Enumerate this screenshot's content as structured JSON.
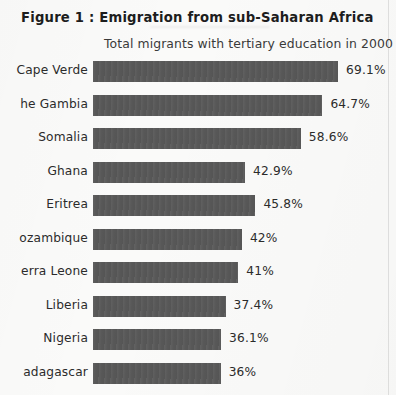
{
  "figure": {
    "title": "Figure 1 : Emigration from sub-Saharan Africa",
    "subtitle": "Total migrants with tertiary education in 2000"
  },
  "chart_data": {
    "type": "bar",
    "orientation": "horizontal",
    "title": "Figure 1 : Emigration from sub-Saharan Africa",
    "subtitle": "Total migrants with tertiary education in 2000",
    "xlabel": "",
    "ylabel": "",
    "xlim": [
      0,
      69.1
    ],
    "grid": false,
    "legend": false,
    "bar_color": "#585858",
    "value_label_suffix": "%",
    "categories": [
      "Cape Verde",
      "The Gambia",
      "Somalia",
      "Ghana",
      "Eritrea",
      "Mozambique",
      "Sierra Leone",
      "Liberia",
      "Nigeria",
      "Madagascar"
    ],
    "category_labels_as_shown": [
      "Cape Verde",
      "he Gambia",
      "Somalia",
      "Ghana",
      "Eritrea",
      "ozambique",
      "erra Leone",
      "Liberia",
      "Nigeria",
      "adagascar"
    ],
    "values": [
      69.1,
      64.7,
      58.6,
      42.9,
      45.8,
      42,
      41,
      37.4,
      36.1,
      36
    ],
    "value_labels": [
      "69.1%",
      "64.7%",
      "58.6%",
      "42.9%",
      "45.8%",
      "42%",
      "41%",
      "37.4%",
      "36.1%",
      "36%"
    ]
  }
}
